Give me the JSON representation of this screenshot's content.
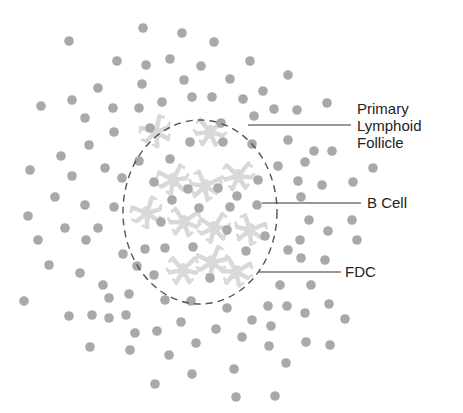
{
  "labels": {
    "follicle": [
      "Primary",
      "Lymphoid",
      "Follicle"
    ],
    "b_cell": "B Cell",
    "fdc": "FDC"
  },
  "colors": {
    "b_cell_dot": "#a9a9a9",
    "fdc_cell": "#d9d9d9",
    "follicle_outline": "#555555",
    "leader_line": "#333333",
    "text": "#222222"
  },
  "follicle_ellipse": {
    "cx": 200,
    "cy": 212,
    "rx": 77,
    "ry": 92
  },
  "leaders": [
    {
      "id": "follicle",
      "x1": 248,
      "y1": 125,
      "x2": 351,
      "y2": 125
    },
    {
      "id": "b_cell",
      "x1": 262,
      "y1": 203,
      "x2": 361,
      "y2": 203
    },
    {
      "id": "fdc",
      "x1": 259,
      "y1": 272,
      "x2": 341,
      "y2": 272
    }
  ],
  "b_cells": [
    [
      143,
      28
    ],
    [
      182,
      33
    ],
    [
      214,
      42
    ],
    [
      69,
      41
    ],
    [
      117,
      61
    ],
    [
      146,
      65
    ],
    [
      170,
      59
    ],
    [
      201,
      66
    ],
    [
      250,
      61
    ],
    [
      142,
      84
    ],
    [
      98,
      88
    ],
    [
      184,
      80
    ],
    [
      230,
      79
    ],
    [
      288,
      75
    ],
    [
      263,
      91
    ],
    [
      243,
      99
    ],
    [
      274,
      109
    ],
    [
      297,
      110
    ],
    [
      327,
      103
    ],
    [
      162,
      102
    ],
    [
      192,
      97
    ],
    [
      212,
      97
    ],
    [
      41,
      106
    ],
    [
      72,
      100
    ],
    [
      113,
      108
    ],
    [
      139,
      108
    ],
    [
      85,
      118
    ],
    [
      254,
      116
    ],
    [
      114,
      132
    ],
    [
      150,
      128
    ],
    [
      221,
      123
    ],
    [
      89,
      145
    ],
    [
      61,
      156
    ],
    [
      190,
      142
    ],
    [
      223,
      142
    ],
    [
      252,
      144
    ],
    [
      288,
      140
    ],
    [
      30,
      170
    ],
    [
      72,
      176
    ],
    [
      105,
      168
    ],
    [
      122,
      178
    ],
    [
      139,
      161
    ],
    [
      170,
      159
    ],
    [
      314,
      151
    ],
    [
      332,
      151
    ],
    [
      305,
      162
    ],
    [
      278,
      166
    ],
    [
      373,
      168
    ],
    [
      298,
      181
    ],
    [
      322,
      185
    ],
    [
      353,
      182
    ],
    [
      258,
      180
    ],
    [
      154,
      182
    ],
    [
      188,
      189
    ],
    [
      218,
      188
    ],
    [
      237,
      196
    ],
    [
      301,
      197
    ],
    [
      55,
      197
    ],
    [
      85,
      205
    ],
    [
      114,
      207
    ],
    [
      172,
      200
    ],
    [
      199,
      208
    ],
    [
      230,
      207
    ],
    [
      257,
      205
    ],
    [
      28,
      216
    ],
    [
      65,
      228
    ],
    [
      98,
      228
    ],
    [
      161,
      222
    ],
    [
      227,
      230
    ],
    [
      265,
      236
    ],
    [
      309,
      220
    ],
    [
      352,
      220
    ],
    [
      328,
      231
    ],
    [
      38,
      240
    ],
    [
      86,
      240
    ],
    [
      300,
      240
    ],
    [
      357,
      240
    ],
    [
      288,
      250
    ],
    [
      301,
      258
    ],
    [
      325,
      260
    ],
    [
      123,
      254
    ],
    [
      145,
      249
    ],
    [
      165,
      248
    ],
    [
      193,
      247
    ],
    [
      246,
      251
    ],
    [
      49,
      265
    ],
    [
      137,
      266
    ],
    [
      80,
      273
    ],
    [
      154,
      275
    ],
    [
      210,
      278
    ],
    [
      103,
      285
    ],
    [
      280,
      285
    ],
    [
      311,
      285
    ],
    [
      109,
      298
    ],
    [
      129,
      294
    ],
    [
      24,
      301
    ],
    [
      165,
      300
    ],
    [
      191,
      301
    ],
    [
      227,
      308
    ],
    [
      268,
      306
    ],
    [
      287,
      306
    ],
    [
      305,
      313
    ],
    [
      329,
      304
    ],
    [
      69,
      316
    ],
    [
      92,
      315
    ],
    [
      109,
      318
    ],
    [
      126,
      315
    ],
    [
      181,
      322
    ],
    [
      252,
      320
    ],
    [
      271,
      326
    ],
    [
      345,
      319
    ],
    [
      135,
      333
    ],
    [
      157,
      331
    ],
    [
      216,
      329
    ],
    [
      242,
      337
    ],
    [
      196,
      343
    ],
    [
      269,
      346
    ],
    [
      306,
      342
    ],
    [
      330,
      345
    ],
    [
      90,
      347
    ],
    [
      130,
      350
    ],
    [
      169,
      355
    ],
    [
      286,
      363
    ],
    [
      192,
      374
    ],
    [
      234,
      369
    ],
    [
      155,
      384
    ],
    [
      236,
      397
    ],
    [
      275,
      396
    ]
  ],
  "fdc_cells": [
    [
      156,
      132
    ],
    [
      210,
      132
    ],
    [
      173,
      180
    ],
    [
      205,
      186
    ],
    [
      238,
      176
    ],
    [
      147,
      213
    ],
    [
      184,
      222
    ],
    [
      214,
      228
    ],
    [
      250,
      230
    ],
    [
      183,
      270
    ],
    [
      212,
      262
    ],
    [
      236,
      272
    ]
  ]
}
